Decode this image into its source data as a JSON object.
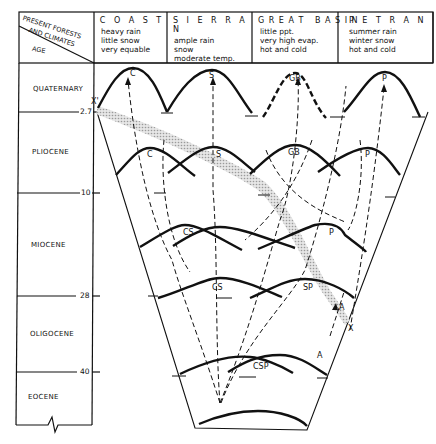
{
  "header": {
    "corner_top": [
      "PRESENT FORESTS",
      "AND CLIMATES"
    ],
    "corner_bottom": "AGE",
    "columns": [
      {
        "title": "C O A S T",
        "lines": [
          "heavy rain",
          "little snow",
          "very equable"
        ]
      },
      {
        "title": "S I E R R A N",
        "lines": [
          "ample rain",
          "snow",
          "moderate temp."
        ]
      },
      {
        "title": "G R E A T   B A S I N",
        "lines": [
          "little ppt.",
          "very high evap.",
          "hot and cold"
        ]
      },
      {
        "title": "P E T R A N",
        "lines": [
          "summer rain",
          "winter snow",
          "hot and cold"
        ]
      }
    ]
  },
  "ages": [
    {
      "name": "QUATERNARY"
    },
    {
      "name": "PLIOCENE"
    },
    {
      "name": "MIOCENE"
    },
    {
      "name": "OLIGOCENE"
    },
    {
      "name": "EOCENE"
    }
  ],
  "boundaries": [
    "2.7",
    "10",
    "28",
    "40"
  ],
  "curve_labels": {
    "quaternary": [
      "C",
      "S",
      "GB",
      "P"
    ],
    "pliocene": [
      "C",
      "S",
      "GB",
      "P"
    ],
    "miocene": [
      "CS",
      "P"
    ],
    "oligocene": [
      "CS",
      "SP"
    ],
    "eocene": [
      "CSP"
    ],
    "markers": [
      "X'",
      "X",
      "A",
      "A"
    ]
  }
}
